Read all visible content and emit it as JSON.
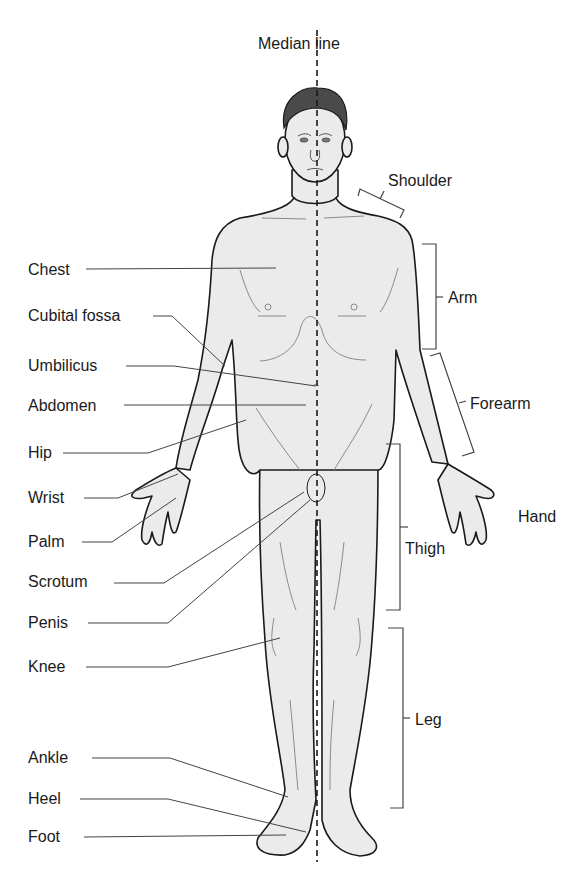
{
  "title": "Median line",
  "left_labels": [
    {
      "id": "chest",
      "text": "Chest",
      "x": 28,
      "y": 263
    },
    {
      "id": "cubital-fossa",
      "text": "Cubital fossa",
      "x": 28,
      "y": 308
    },
    {
      "id": "umbilicus",
      "text": "Umbilicus",
      "x": 28,
      "y": 357
    },
    {
      "id": "abdomen",
      "text": "Abdomen",
      "x": 28,
      "y": 398
    },
    {
      "id": "hip",
      "text": "Hip",
      "x": 28,
      "y": 444
    },
    {
      "id": "wrist",
      "text": "Wrist",
      "x": 28,
      "y": 488
    },
    {
      "id": "palm",
      "text": "Palm",
      "x": 28,
      "y": 532
    },
    {
      "id": "scrotum",
      "text": "Scrotum",
      "x": 28,
      "y": 571
    },
    {
      "id": "penis",
      "text": "Penis",
      "x": 28,
      "y": 614
    },
    {
      "id": "knee",
      "text": "Knee",
      "x": 28,
      "y": 657
    },
    {
      "id": "ankle",
      "text": "Ankle",
      "x": 28,
      "y": 751
    },
    {
      "id": "heel",
      "text": "Heel",
      "x": 28,
      "y": 791
    },
    {
      "id": "foot",
      "text": "Foot",
      "x": 28,
      "y": 828
    }
  ],
  "right_labels": [
    {
      "id": "shoulder",
      "text": "Shoulder",
      "x": 388,
      "y": 172
    },
    {
      "id": "arm",
      "text": "Arm",
      "x": 448,
      "y": 290
    },
    {
      "id": "forearm",
      "text": "Forearm",
      "x": 470,
      "y": 396
    },
    {
      "id": "hand",
      "text": "Hand",
      "x": 518,
      "y": 508
    },
    {
      "id": "thigh",
      "text": "Thigh",
      "x": 404,
      "y": 541
    },
    {
      "id": "leg",
      "text": "Leg",
      "x": 415,
      "y": 711
    }
  ],
  "colors": {
    "skin": "#ebebeb",
    "outline": "#1a1a1a",
    "leader": "#444444",
    "hair": "#4a4a4a",
    "detail": "#8a8a8a"
  }
}
